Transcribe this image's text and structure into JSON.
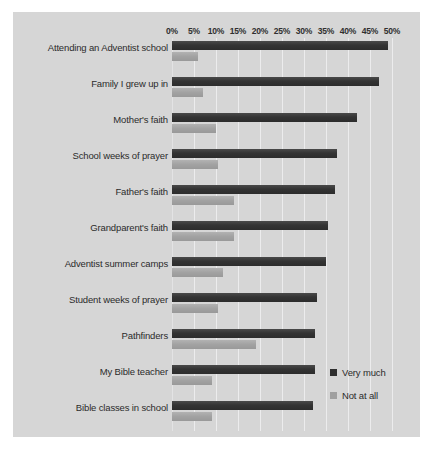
{
  "chart_data": {
    "type": "bar",
    "orientation": "horizontal",
    "title": "",
    "xlabel": "",
    "ylabel": "",
    "xlim": [
      0,
      50
    ],
    "xtick_labels": [
      "0%",
      "5%",
      "10%",
      "15%",
      "20%",
      "25%",
      "30%",
      "35%",
      "40%",
      "45%",
      "50%"
    ],
    "xtick_values": [
      0,
      5,
      10,
      15,
      20,
      25,
      30,
      35,
      40,
      45,
      50
    ],
    "grid": true,
    "legend_position": "bottom-right",
    "categories": [
      "Attending an Adventist school",
      "Family I grew up in",
      "Mother's faith",
      "School weeks of prayer",
      "Father's faith",
      "Grandparent's faith",
      "Adventist summer camps",
      "Student weeks of prayer",
      "Pathfinders",
      "My Bible teacher",
      "Bible classes in school"
    ],
    "series": [
      {
        "name": "Very much",
        "color": "#2f2f2f",
        "values": [
          49,
          47,
          42,
          37.5,
          37,
          35.5,
          35,
          33,
          32.5,
          32.5,
          32
        ]
      },
      {
        "name": "Not at all",
        "color": "#a0a0a0",
        "values": [
          6,
          7,
          10,
          10.5,
          14,
          14,
          11.5,
          10.5,
          19,
          9,
          9
        ]
      }
    ]
  },
  "legend": {
    "items": [
      {
        "label": "Very much"
      },
      {
        "label": "Not at all"
      }
    ]
  }
}
